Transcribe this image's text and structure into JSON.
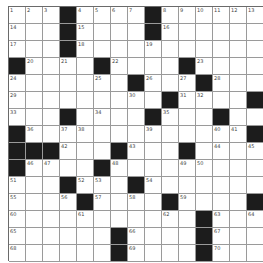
{
  "puzzle": {
    "rows": 15,
    "cols": 15,
    "grid": [
      "...#....#......",
      "...#....#......",
      "...#...........",
      "#....#....#....",
      ".......#...#...",
      ".........#....#",
      "...#....#...#..",
      "#.............#",
      "###...#...#....",
      "#....#.........",
      "...#...#.......",
      "....#....#....#",
      "...........#...",
      "......#....#...",
      "......#....#..."
    ],
    "numbers": [
      [
        1,
        0,
        0
      ],
      [
        2,
        0,
        1
      ],
      [
        3,
        0,
        2
      ],
      [
        4,
        0,
        4
      ],
      [
        5,
        0,
        5
      ],
      [
        6,
        0,
        6
      ],
      [
        7,
        0,
        7
      ],
      [
        8,
        0,
        9
      ],
      [
        9,
        0,
        10
      ],
      [
        10,
        0,
        11
      ],
      [
        11,
        0,
        12
      ],
      [
        12,
        0,
        13
      ],
      [
        13,
        0,
        14
      ],
      [
        14,
        1,
        0
      ],
      [
        15,
        1,
        4
      ],
      [
        16,
        1,
        9
      ],
      [
        17,
        2,
        0
      ],
      [
        18,
        2,
        4
      ],
      [
        19,
        2,
        8
      ],
      [
        20,
        3,
        1
      ],
      [
        21,
        3,
        3
      ],
      [
        22,
        3,
        6
      ],
      [
        23,
        3,
        11
      ],
      [
        24,
        4,
        0
      ],
      [
        25,
        4,
        5
      ],
      [
        26,
        4,
        8
      ],
      [
        27,
        4,
        10
      ],
      [
        28,
        4,
        12
      ],
      [
        29,
        5,
        0
      ],
      [
        30,
        5,
        7
      ],
      [
        31,
        5,
        10
      ],
      [
        32,
        5,
        11
      ],
      [
        33,
        6,
        0
      ],
      [
        34,
        6,
        5
      ],
      [
        35,
        6,
        9
      ],
      [
        36,
        7,
        1
      ],
      [
        37,
        7,
        3
      ],
      [
        38,
        7,
        4
      ],
      [
        39,
        7,
        8
      ],
      [
        40,
        7,
        12
      ],
      [
        41,
        7,
        13
      ],
      [
        42,
        8,
        3
      ],
      [
        43,
        8,
        7
      ],
      [
        44,
        8,
        12
      ],
      [
        45,
        8,
        14
      ],
      [
        46,
        9,
        1
      ],
      [
        47,
        9,
        2
      ],
      [
        48,
        9,
        6
      ],
      [
        49,
        9,
        10
      ],
      [
        50,
        9,
        11
      ],
      [
        51,
        10,
        0
      ],
      [
        52,
        10,
        4
      ],
      [
        53,
        10,
        5
      ],
      [
        54,
        10,
        8
      ],
      [
        55,
        11,
        0
      ],
      [
        56,
        11,
        3
      ],
      [
        57,
        11,
        5
      ],
      [
        58,
        11,
        7
      ],
      [
        59,
        11,
        10
      ],
      [
        60,
        12,
        0
      ],
      [
        61,
        12,
        4
      ],
      [
        62,
        12,
        9
      ],
      [
        63,
        12,
        12
      ],
      [
        64,
        12,
        14
      ],
      [
        65,
        13,
        0
      ],
      [
        66,
        13,
        7
      ],
      [
        67,
        13,
        12
      ],
      [
        68,
        14,
        0
      ],
      [
        69,
        14,
        7
      ],
      [
        70,
        14,
        12
      ]
    ]
  }
}
